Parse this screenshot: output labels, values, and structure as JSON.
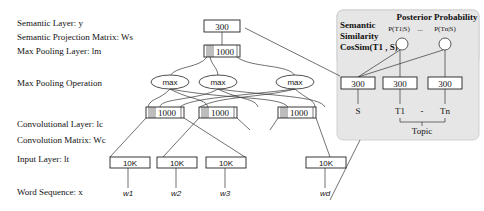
{
  "left_labels": {
    "semantic_layer": "Semantic Layer: y",
    "projection_matrix": "Semantic Projection Matrix: Ws",
    "max_pooling_layer": "Max Pooling Layer: lm",
    "max_pooling_op": "Max Pooling Operation",
    "conv_layer": "Convolutional Layer: lc",
    "conv_matrix": "Convolution Matrix: Wc",
    "input_layer": "Input Layer: lt",
    "word_sequence": "Word Sequence: x"
  },
  "network": {
    "semantic_box": "300",
    "pool_box": "1000",
    "max_ops": [
      "max",
      "max",
      "max"
    ],
    "conv_boxes": [
      "1000",
      "1000",
      "1000"
    ],
    "input_boxes": [
      "10K",
      "10K",
      "10K",
      "10K"
    ],
    "words": [
      "w1",
      "w2",
      "w3",
      "wd"
    ]
  },
  "panel": {
    "title": "Posterior Probability",
    "prob_left": "P(T1|S)",
    "prob_sep": "...",
    "prob_right": "P(Tn|S)",
    "similarity_line1": "Semantic",
    "similarity_line2": "Similarity",
    "similarity_line3": "CosSim(T1 , S)",
    "boxes": [
      "300",
      "300",
      "300"
    ],
    "s_label": "S",
    "t1_label": "T1",
    "dash": "-",
    "tn_label": "Tn",
    "topic_label": "Topic",
    "bg_color": "#e8e8e8"
  }
}
